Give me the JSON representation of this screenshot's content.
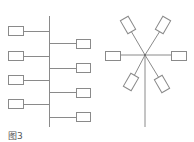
{
  "figure": {
    "caption": "图3",
    "stroke_color": "#8a8a8a",
    "box_fill": "#ffffff"
  },
  "bus_topology": {
    "backbone": {
      "x": 49,
      "y1": 16,
      "y2": 127
    },
    "left_nodes": [
      {
        "y": 31
      },
      {
        "y": 56
      },
      {
        "y": 80
      },
      {
        "y": 104
      }
    ],
    "right_nodes": [
      {
        "y": 43
      },
      {
        "y": 68
      },
      {
        "y": 92
      },
      {
        "y": 117
      }
    ]
  },
  "star_topology": {
    "center": {
      "x": 145,
      "y": 55
    },
    "tail_end_y": 127,
    "nodes": [
      {
        "position": "upper-left"
      },
      {
        "position": "upper-right"
      },
      {
        "position": "left"
      },
      {
        "position": "right"
      },
      {
        "position": "lower-left"
      },
      {
        "position": "lower-right"
      }
    ]
  }
}
